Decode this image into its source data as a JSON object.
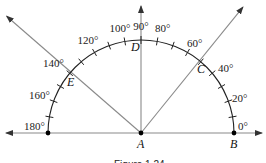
{
  "diagram": {
    "caption": "Figure 1.24",
    "scale": {
      "min_deg": 0,
      "max_deg": 180,
      "tick_step_deg": 10,
      "labels": [
        {
          "deg": 0,
          "text": "0°"
        },
        {
          "deg": 20,
          "text": "20°"
        },
        {
          "deg": 40,
          "text": "40°"
        },
        {
          "deg": 60,
          "text": "60°"
        },
        {
          "deg": 80,
          "text": "80°"
        },
        {
          "deg": 90,
          "text": "90°"
        },
        {
          "deg": 100,
          "text": "100°"
        },
        {
          "deg": 120,
          "text": "120°"
        },
        {
          "deg": 140,
          "text": "140°"
        },
        {
          "deg": 160,
          "text": "160°"
        },
        {
          "deg": 180,
          "text": "180°"
        }
      ]
    },
    "points": {
      "A": "A",
      "B": "B",
      "C": "C",
      "D": "D",
      "E": "E"
    },
    "rays": [
      {
        "name": "ray-AB",
        "through": "B",
        "deg": 0
      },
      {
        "name": "ray-AC",
        "through": "C",
        "deg": 51
      },
      {
        "name": "ray-AD",
        "through": "D",
        "deg": 90
      },
      {
        "name": "ray-AE",
        "through": "E",
        "deg": 139
      },
      {
        "name": "ray-opposite-AB",
        "deg": 180
      }
    ],
    "colors": {
      "ray": "#8a8a8a",
      "arc": "#222222",
      "text": "#222222"
    }
  }
}
